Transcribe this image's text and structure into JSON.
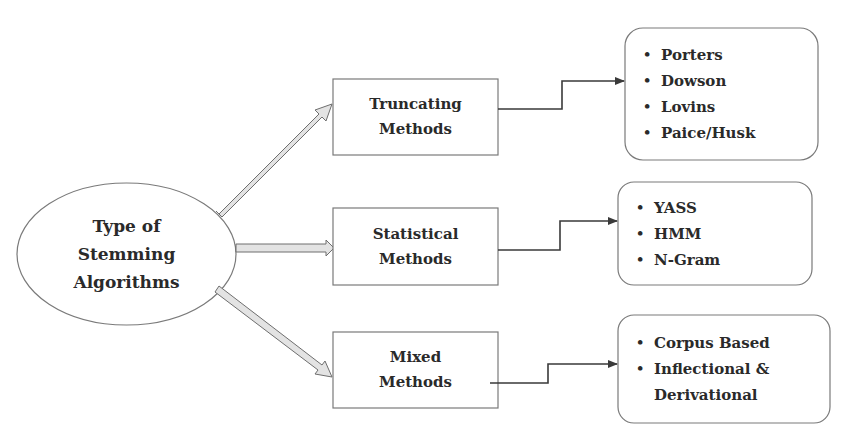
{
  "diagram": {
    "root": {
      "lines": [
        "Type of",
        "Stemming",
        "Algorithms"
      ]
    },
    "categories": [
      {
        "lines": [
          "Truncating",
          "Methods"
        ],
        "items": [
          "Porters",
          "Dowson",
          "Lovins",
          "Paice/Husk"
        ]
      },
      {
        "lines": [
          "Statistical",
          "Methods"
        ],
        "items": [
          "YASS",
          "HMM",
          "N-Gram"
        ]
      },
      {
        "lines": [
          "Mixed",
          "Methods"
        ],
        "items": [
          "Corpus Based",
          "Inflectional &\nDerivational"
        ]
      }
    ],
    "bullet_glyph": "•",
    "colors": {
      "stroke": "#6e6e6e",
      "arrow_fill": "#e3e3e3",
      "connector": "#3a3a3a",
      "text": "#2a2a2a",
      "background": "#ffffff"
    }
  }
}
